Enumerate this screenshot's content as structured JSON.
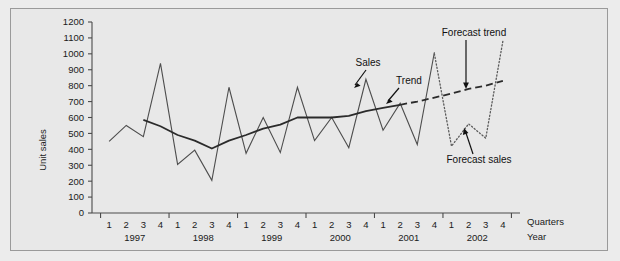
{
  "chart_data": {
    "type": "line",
    "title": "",
    "xlabel_quarters": "Quarters",
    "xlabel_year": "Year",
    "ylabel": "Unit sales",
    "ylim": [
      0,
      1200
    ],
    "ytick_step": 100,
    "yticks": [
      0,
      100,
      200,
      300,
      400,
      500,
      600,
      700,
      800,
      900,
      1000,
      1100,
      1200
    ],
    "grid": false,
    "legend": "annotations",
    "years": [
      "1997",
      "1998",
      "1999",
      "2000",
      "2001",
      "2002"
    ],
    "quarters": [
      "1",
      "2",
      "3",
      "4"
    ],
    "x": [
      "1997 Q1",
      "1997 Q2",
      "1997 Q3",
      "1997 Q4",
      "1998 Q1",
      "1998 Q2",
      "1998 Q3",
      "1998 Q4",
      "1999 Q1",
      "1999 Q2",
      "1999 Q3",
      "1999 Q4",
      "2000 Q1",
      "2000 Q2",
      "2000 Q3",
      "2000 Q4",
      "2001 Q1",
      "2001 Q2",
      "2001 Q3",
      "2001 Q4",
      "2002 Q1",
      "2002 Q2",
      "2002 Q3",
      "2002 Q4"
    ],
    "series": [
      {
        "name": "Sales",
        "style": "solid-thin",
        "values": [
          450,
          550,
          480,
          940,
          305,
          395,
          205,
          790,
          375,
          600,
          380,
          790,
          455,
          600,
          410,
          840,
          520,
          690,
          430,
          1010,
          null,
          null,
          null,
          null
        ]
      },
      {
        "name": "Trend",
        "style": "solid-thick",
        "values": [
          null,
          null,
          585,
          545,
          490,
          455,
          405,
          455,
          490,
          530,
          555,
          600,
          600,
          600,
          610,
          640,
          660,
          680,
          null,
          null,
          null,
          null,
          null,
          null
        ]
      },
      {
        "name": "Forecast trend",
        "style": "dashed",
        "values": [
          null,
          null,
          null,
          null,
          null,
          null,
          null,
          null,
          null,
          null,
          null,
          null,
          null,
          null,
          null,
          null,
          null,
          680,
          700,
          725,
          750,
          780,
          800,
          830
        ]
      },
      {
        "name": "Forecast sales",
        "style": "dotted",
        "values": [
          null,
          null,
          null,
          null,
          null,
          null,
          null,
          null,
          null,
          null,
          null,
          null,
          null,
          null,
          null,
          null,
          null,
          null,
          null,
          1000,
          420,
          560,
          470,
          1080
        ]
      }
    ],
    "annotations": [
      {
        "name": "sales",
        "text": "Sales"
      },
      {
        "name": "trend",
        "text": "Trend"
      },
      {
        "name": "forecast-trend",
        "text": "Forecast trend"
      },
      {
        "name": "forecast-sales",
        "text": "Forecast sales"
      }
    ],
    "colors": {
      "background": "#e8e8e8",
      "border": "#9a9a9a",
      "axis": "#4a4a4a",
      "sales": "#4d4d4d",
      "trend": "#2b2b2b",
      "forecast": "#5a5a5a"
    }
  }
}
